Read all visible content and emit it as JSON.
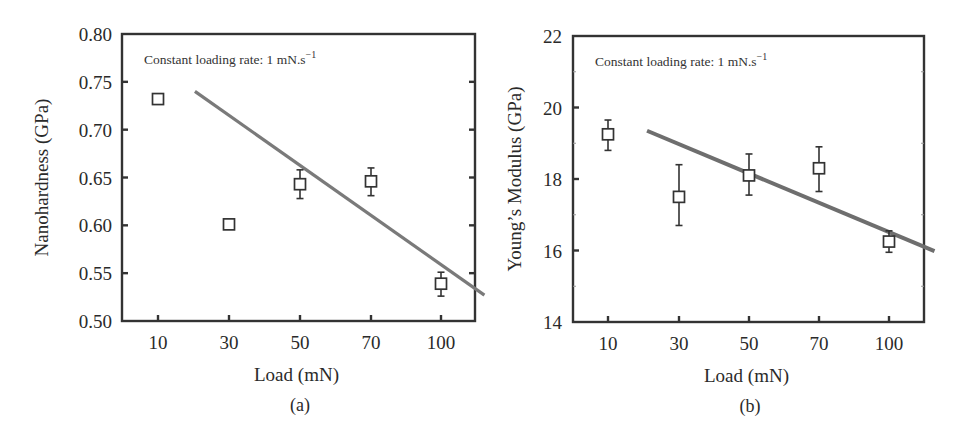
{
  "chart_data": [
    {
      "id": "a",
      "type": "scatter",
      "panel_label": "(a)",
      "title": "",
      "annotation": "Constant loading rate: 1 mN.s",
      "annotation_superscript": "−1",
      "xlabel": "Load (mN)",
      "ylabel": "Nanohardness (GPa)",
      "x_tick_labels": [
        "10",
        "30",
        "50",
        "70",
        "100"
      ],
      "y_ticks": [
        0.5,
        0.55,
        0.6,
        0.65,
        0.7,
        0.75,
        0.8
      ],
      "y_tick_labels": [
        "0.50",
        "0.55",
        "0.60",
        "0.65",
        "0.70",
        "0.75",
        "0.80"
      ],
      "ylim": [
        0.5,
        0.8
      ],
      "grid": false,
      "legend": null,
      "series": [
        {
          "name": "Nanohardness",
          "marker": "open-square",
          "x": [
            "10",
            "30",
            "50",
            "70",
            "100"
          ],
          "values": [
            0.732,
            0.601,
            0.643,
            0.646,
            0.539
          ],
          "err_low": [
            0.727,
            0.598,
            0.628,
            0.631,
            0.526
          ],
          "err_high": [
            0.735,
            0.604,
            0.658,
            0.66,
            0.551
          ]
        }
      ],
      "fit_line": {
        "name": "Linear fit",
        "color": "#7a7a7a",
        "start": [
          0.52,
          0.74
        ],
        "end": [
          4.62,
          0.527
        ]
      }
    },
    {
      "id": "b",
      "type": "scatter",
      "panel_label": "(b)",
      "title": "",
      "annotation": "Constant loading rate: 1 mN.s",
      "annotation_superscript": "−1",
      "xlabel": "Load (mN)",
      "ylabel": "Young’s Modulus (GPa)",
      "x_tick_labels": [
        "10",
        "30",
        "50",
        "70",
        "100"
      ],
      "y_ticks": [
        14,
        16,
        18,
        20,
        22
      ],
      "y_tick_labels": [
        "14",
        "16",
        "18",
        "20",
        "22"
      ],
      "ylim": [
        14,
        22
      ],
      "grid": false,
      "legend": null,
      "series": [
        {
          "name": "Young's Modulus",
          "marker": "open-square",
          "x": [
            "10",
            "30",
            "50",
            "70",
            "100"
          ],
          "values": [
            19.25,
            17.5,
            18.1,
            18.3,
            16.25
          ],
          "err_low": [
            18.8,
            16.7,
            17.55,
            17.65,
            15.95
          ],
          "err_high": [
            19.65,
            18.4,
            18.7,
            18.9,
            16.55
          ]
        }
      ],
      "fit_line": {
        "name": "Linear fit",
        "color": "#6e6e6e",
        "start": [
          0.55,
          19.35
        ],
        "end": [
          4.65,
          15.98
        ]
      }
    }
  ]
}
